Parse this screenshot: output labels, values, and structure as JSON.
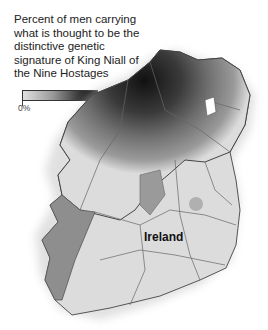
{
  "title": "Percent of men carrying what is thought to be the distinctive genetic signature of King Niall of the Nine Hostages",
  "legend": {
    "min_label": "0%",
    "max_label": "17%",
    "colors": [
      "#e0e0e0",
      "#0c0c0c"
    ]
  },
  "map": {
    "country_label": "Ireland",
    "regions": [
      {
        "name": "northwest (darkest)",
        "level": "high",
        "color": "#1a1a1a"
      },
      {
        "name": "north / northwest counties",
        "level": "medium-high",
        "color": "#555555"
      },
      {
        "name": "west coast",
        "level": "medium",
        "color": "#8a8a8a"
      },
      {
        "name": "south and east",
        "level": "low",
        "color": "#dcdcdc"
      }
    ]
  }
}
